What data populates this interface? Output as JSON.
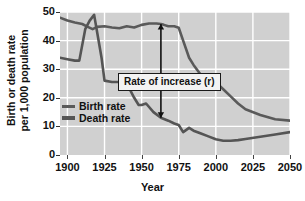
{
  "chart_data": {
    "type": "line",
    "title": "",
    "xlabel": "Year",
    "ylabel_line1": "Birth or death rate",
    "ylabel_line2": "per 1,000 population",
    "xlim": [
      1895,
      2050
    ],
    "ylim": [
      0,
      50
    ],
    "xticks": [
      1900,
      1925,
      1950,
      1975,
      2000,
      2025,
      2050
    ],
    "xticklabels": [
      "1900",
      "1925",
      "1950",
      "1975",
      "2000",
      "2025",
      "2050"
    ],
    "yticks": [
      0,
      10,
      20,
      30,
      40,
      50
    ],
    "yticklabels": [
      "0",
      "10",
      "20",
      "30",
      "40",
      "50"
    ],
    "grid": true,
    "legend_position": "center-left",
    "series": [
      {
        "name": "Birth rate",
        "color": "#5a5a5a",
        "x": [
          1895,
          1900,
          1905,
          1910,
          1913,
          1917,
          1920,
          1925,
          1930,
          1935,
          1940,
          1945,
          1950,
          1955,
          1960,
          1963,
          1965,
          1968,
          1972,
          1975,
          1978,
          1982,
          1985,
          1990,
          1995,
          2000,
          2005,
          2010,
          2015,
          2020,
          2030,
          2040,
          2050
        ],
        "y": [
          48.0,
          47.0,
          46.3,
          45.8,
          45.0,
          44.0,
          44.8,
          45.0,
          44.6,
          44.3,
          45.0,
          44.6,
          45.5,
          46.0,
          46.0,
          45.8,
          45.5,
          45.0,
          45.0,
          44.5,
          40.0,
          34.0,
          31.5,
          28.0,
          26.0,
          25.5,
          23.0,
          20.5,
          18.0,
          16.0,
          14.0,
          12.5,
          12.0
        ]
      },
      {
        "name": "Death rate",
        "color": "#555555",
        "x": [
          1895,
          1900,
          1905,
          1908,
          1912,
          1915,
          1918,
          1920,
          1923,
          1925,
          1930,
          1935,
          1940,
          1945,
          1948,
          1950,
          1953,
          1958,
          1963,
          1968,
          1972,
          1975,
          1978,
          1982,
          1985,
          1990,
          1995,
          2000,
          2005,
          2010,
          2015,
          2020,
          2030,
          2040,
          2050
        ],
        "y": [
          34.0,
          33.5,
          33.0,
          33.0,
          44.0,
          47.0,
          49.0,
          43.0,
          34.0,
          26.0,
          25.5,
          25.5,
          25.0,
          20.0,
          17.5,
          17.5,
          18.0,
          15.0,
          13.0,
          12.0,
          11.0,
          10.5,
          8.0,
          9.5,
          8.5,
          7.5,
          6.5,
          5.5,
          5.0,
          5.0,
          5.2,
          5.6,
          6.4,
          7.2,
          8.0
        ]
      }
    ],
    "annotations": [
      {
        "label": "Rate  of increase (r)",
        "type": "double-arrow-with-box",
        "x": 1963,
        "y_top": 45.8,
        "y_bottom": 13.0
      }
    ]
  },
  "legend": {
    "items": [
      {
        "label": "Birth rate"
      },
      {
        "label": "Death rate"
      }
    ]
  }
}
